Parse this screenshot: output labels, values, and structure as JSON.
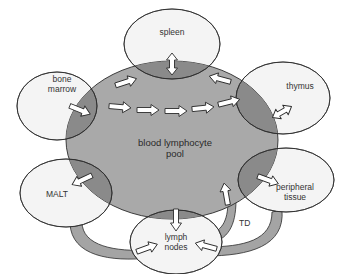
{
  "diagram": {
    "center": {
      "label_line1": "blood lymphocyte",
      "label_line2": "pool"
    },
    "organs": {
      "spleen": {
        "label": "spleen"
      },
      "bone_marrow": {
        "label_line1": "bone",
        "label_line2": "marrow"
      },
      "thymus": {
        "label": "thymus"
      },
      "malt": {
        "label": "MALT"
      },
      "peripheral_tissue": {
        "label_line1": "peripheral",
        "label_line2": "tissue"
      },
      "lymph_nodes": {
        "label_line1": "lymph",
        "label_line2": "nodes"
      }
    },
    "pathway_labels": {
      "td": "TD"
    },
    "flows": [
      {
        "from": "bone_marrow",
        "to": "spleen"
      },
      {
        "from": "bone_marrow",
        "to": "thymus",
        "via": "blood"
      },
      {
        "from": "thymus",
        "to": "spleen"
      },
      {
        "from": "spleen",
        "to": "blood",
        "bidirectional": true
      },
      {
        "from": "thymus",
        "to": "blood",
        "bidirectional": true
      },
      {
        "from": "blood",
        "to": "malt"
      },
      {
        "from": "blood",
        "to": "peripheral_tissue"
      },
      {
        "from": "blood",
        "to": "lymph_nodes"
      },
      {
        "from": "malt",
        "to": "lymph_nodes"
      },
      {
        "from": "peripheral_tissue",
        "to": "lymph_nodes"
      },
      {
        "from": "lymph_nodes",
        "to": "blood",
        "label": "TD"
      }
    ],
    "colors": {
      "background": "#ffffff",
      "pool_fill": "#a9a9a9",
      "overlap_fill": "#8a8a8a",
      "organ_fill": "#f4f4f4",
      "pathway_fill": "#a4a4a4",
      "arrow_fill": "#ffffff",
      "stroke": "#2b2b2b"
    }
  }
}
